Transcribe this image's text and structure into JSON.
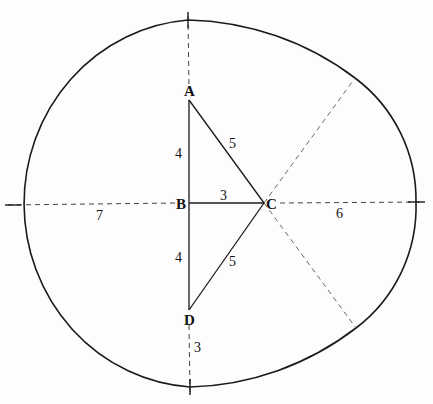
{
  "diagram": {
    "points": {
      "A": {
        "label": "A",
        "x": 189,
        "y": 100
      },
      "B": {
        "label": "B",
        "x": 189,
        "y": 203
      },
      "C": {
        "label": "C",
        "x": 264,
        "y": 203
      },
      "D": {
        "label": "D",
        "x": 189,
        "y": 310
      }
    },
    "lengths": {
      "AB": "4",
      "BD": "4",
      "AC": "5",
      "DC": "5",
      "BC": "3",
      "B_left": "7",
      "C_right": "6",
      "D_bottom": "3"
    },
    "colors": {
      "stroke": "#1a1a1a",
      "dash": "#555555"
    }
  }
}
